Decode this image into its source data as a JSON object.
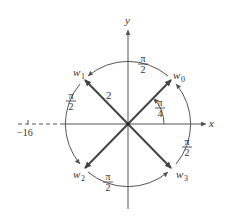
{
  "diagram": {
    "axes": {
      "x_label": "x",
      "y_label": "y"
    },
    "circle_radius_label": "2",
    "angle_label_num": "π",
    "angle_label_den": "4",
    "arc_labels": [
      {
        "num": "π",
        "den": "2"
      },
      {
        "num": "π",
        "den": "2"
      },
      {
        "num": "π",
        "den": "2"
      },
      {
        "num": "π",
        "den": "2"
      }
    ],
    "roots": [
      {
        "name": "w",
        "sub": "0"
      },
      {
        "name": "w",
        "sub": "1"
      },
      {
        "name": "w",
        "sub": "2"
      },
      {
        "name": "w",
        "sub": "3"
      }
    ],
    "tick_label": "−16",
    "colors": {
      "stroke": "#444444",
      "text": "#333333",
      "background": "#ffffff"
    }
  }
}
